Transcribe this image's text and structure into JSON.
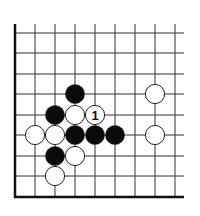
{
  "diagram": {
    "type": "go-board-problem",
    "board": {
      "origin_x": 15,
      "origin_y": 197,
      "col_spacing": 20,
      "row_spacing": 20.5,
      "columns": 9,
      "rows": 8,
      "right_extent": 184,
      "top_extent": 24,
      "edges": [
        "left",
        "bottom"
      ]
    },
    "stones": [
      {
        "color": "black",
        "col": 3,
        "row": 3
      },
      {
        "color": "black",
        "col": 2,
        "row": 4
      },
      {
        "color": "white",
        "col": 3,
        "row": 4
      },
      {
        "color": "white",
        "col": 4,
        "row": 4,
        "label": "1"
      },
      {
        "color": "white",
        "col": 7,
        "row": 3
      },
      {
        "color": "white",
        "col": 1,
        "row": 5
      },
      {
        "color": "white",
        "col": 2,
        "row": 5
      },
      {
        "color": "black",
        "col": 3,
        "row": 5
      },
      {
        "color": "black",
        "col": 4,
        "row": 5
      },
      {
        "color": "black",
        "col": 5,
        "row": 5
      },
      {
        "color": "white",
        "col": 7,
        "row": 5
      },
      {
        "color": "black",
        "col": 2,
        "row": 6
      },
      {
        "color": "white",
        "col": 3,
        "row": 6
      },
      {
        "color": "white",
        "col": 2,
        "row": 7
      }
    ],
    "colors": {
      "line": "#333333",
      "edge": "#111111",
      "black_stone": "#0a0a0a",
      "white_stone": "#ffffff",
      "stone_outline": "#222222"
    }
  }
}
